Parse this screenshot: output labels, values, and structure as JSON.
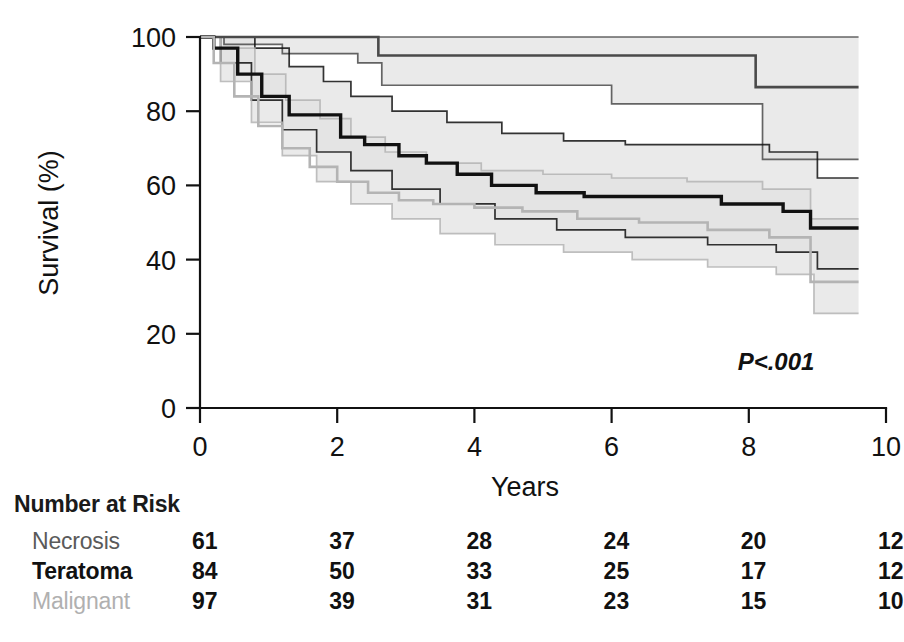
{
  "figure": {
    "p_value": "P<.001",
    "xlabel": "Years",
    "ylabel": "Survival (%)",
    "risk_title": "Number at Risk"
  },
  "colors": {
    "necrosis": "#4a4a4a",
    "teratoma": "#111111",
    "malignant": "#b4b4b4",
    "band_light": "#e2e2e2",
    "band_mid": "#d2d2d2",
    "band_dark": "#c2c2c2",
    "axis": "#111111"
  },
  "chart_data": {
    "type": "line",
    "title": "",
    "xlabel": "Years",
    "ylabel": "Survival (%)",
    "xlim": [
      0,
      10
    ],
    "ylim": [
      0,
      100
    ],
    "xticks": [
      0,
      2,
      4,
      6,
      8,
      10
    ],
    "yticks": [
      0,
      20,
      40,
      60,
      80,
      100
    ],
    "grid": false,
    "legend_position": "none",
    "annotations": [
      "P<.001"
    ],
    "series": [
      {
        "name": "Necrosis",
        "color": "#4a4a4a",
        "kind": "kaplan-meier-step",
        "x": [
          0,
          0.35,
          1.1,
          2.25,
          2.6,
          5.6,
          5.9,
          7.75,
          8.1,
          9.6
        ],
        "y": [
          100,
          100,
          100,
          100,
          95,
          95,
          95,
          95,
          86.5,
          86.5
        ],
        "ci_upper_x": [
          0,
          1.65,
          2.25,
          5.6,
          9.6
        ],
        "ci_upper_y": [
          100,
          100,
          100,
          100,
          100
        ],
        "ci_lower_x": [
          0,
          0.35,
          1.2,
          2.3,
          2.65,
          5.6,
          6.0,
          7.8,
          8.2,
          9.6
        ],
        "ci_lower_y": [
          100,
          98,
          95.5,
          93,
          87,
          87,
          82,
          82,
          67,
          67
        ]
      },
      {
        "name": "Teratoma",
        "color": "#111111",
        "kind": "kaplan-meier-step",
        "x": [
          0,
          0.2,
          0.55,
          0.9,
          1.3,
          1.75,
          2.05,
          2.4,
          2.9,
          3.3,
          3.75,
          4.25,
          4.9,
          5.6,
          6.4,
          7.6,
          8.5,
          8.9,
          9.6
        ],
        "y": [
          100,
          97,
          90,
          84,
          79,
          79,
          73,
          71,
          68,
          66,
          63,
          60,
          58,
          57,
          57,
          55,
          53,
          48.5,
          48.5
        ],
        "ci_upper_x": [
          0,
          0.3,
          0.8,
          1.3,
          1.8,
          2.2,
          2.8,
          3.6,
          4.4,
          5.3,
          6.2,
          7.3,
          8.3,
          9.0,
          9.6
        ],
        "ci_upper_y": [
          100,
          100,
          97,
          92,
          88,
          84,
          80,
          77,
          74,
          72,
          71,
          71,
          69,
          62,
          62
        ],
        "ci_lower_x": [
          0,
          0.3,
          0.75,
          1.2,
          1.7,
          2.2,
          2.8,
          3.5,
          4.3,
          5.2,
          6.2,
          7.4,
          8.4,
          9.0,
          9.6
        ],
        "ci_lower_y": [
          100,
          93,
          83,
          75,
          69,
          64,
          59,
          55,
          51,
          48,
          46,
          44,
          42,
          37.5,
          37.5
        ]
      },
      {
        "name": "Malignant",
        "color": "#b4b4b4",
        "kind": "kaplan-meier-step",
        "x": [
          0,
          0.2,
          0.5,
          0.85,
          1.2,
          1.6,
          2.0,
          2.45,
          2.9,
          3.4,
          4.0,
          4.7,
          5.5,
          6.4,
          7.4,
          8.3,
          8.9,
          9.6
        ],
        "y": [
          100,
          93,
          84,
          76,
          70,
          65,
          61,
          58,
          56,
          55,
          54,
          53,
          51,
          50,
          48,
          46,
          34,
          34
        ],
        "ci_upper_x": [
          0,
          0.3,
          0.8,
          1.25,
          1.75,
          2.2,
          2.7,
          3.3,
          4.1,
          5.0,
          6.0,
          7.1,
          8.2,
          8.9,
          9.6
        ],
        "ci_upper_y": [
          100,
          97,
          90,
          83,
          78,
          73,
          69,
          66,
          64,
          63,
          62,
          61,
          59,
          51,
          51
        ],
        "ci_lower_x": [
          0,
          0.3,
          0.75,
          1.2,
          1.7,
          2.2,
          2.8,
          3.5,
          4.3,
          5.3,
          6.3,
          7.4,
          8.4,
          8.95,
          9.6
        ],
        "ci_lower_y": [
          100,
          88,
          77,
          68,
          61,
          55,
          51,
          47,
          44,
          42,
          40,
          38,
          36,
          25.5,
          25.5
        ]
      }
    ]
  },
  "risk_table": {
    "title": "Number at Risk",
    "columns": [
      "0",
      "2",
      "4",
      "6",
      "8",
      "10"
    ],
    "rows": [
      {
        "label": "Necrosis",
        "color": "#5a5a5a",
        "weight": "normal",
        "values": [
          "61",
          "37",
          "28",
          "24",
          "20",
          "12"
        ]
      },
      {
        "label": "Teratoma",
        "color": "#111111",
        "weight": "bold",
        "values": [
          "84",
          "50",
          "33",
          "25",
          "17",
          "12"
        ]
      },
      {
        "label": "Malignant",
        "color": "#b0b0b0",
        "weight": "normal",
        "values": [
          "97",
          "39",
          "31",
          "23",
          "15",
          "10"
        ]
      }
    ]
  }
}
